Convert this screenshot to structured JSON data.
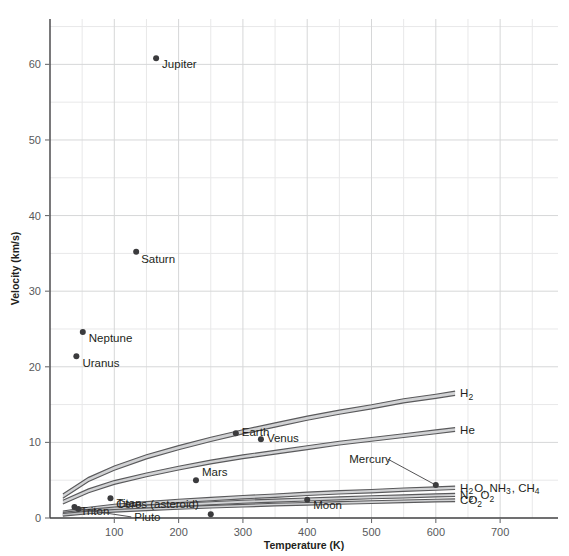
{
  "chart_data": {
    "type": "scatter",
    "title": "",
    "xlabel": "Temperature (K)",
    "ylabel": "Velocity (km/s)",
    "xlim": [
      0,
      790
    ],
    "ylim": [
      0,
      66
    ],
    "grid": true,
    "legend_position": "inline-right",
    "x_ticks": [
      100,
      200,
      300,
      400,
      500,
      600,
      700
    ],
    "x_tick_labels": [
      "100",
      "200",
      "300",
      "400",
      "500",
      "600",
      "700"
    ],
    "x_minor_ticks": [
      50,
      150,
      250,
      350,
      450,
      550,
      650,
      750
    ],
    "y_ticks": [
      0,
      10,
      20,
      30,
      40,
      50,
      60
    ],
    "y_tick_labels": [
      "0",
      "10",
      "20",
      "30",
      "40",
      "50",
      "60"
    ],
    "y_minor_ticks": [
      5,
      15,
      25,
      35,
      45,
      55,
      65
    ],
    "points": [
      {
        "name": "Jupiter",
        "label": "Jupiter",
        "x": 165,
        "y": 60.8,
        "label_dx": 6,
        "label_dy": 10,
        "leader": false
      },
      {
        "name": "Saturn",
        "label": "Saturn",
        "x": 134,
        "y": 35.2,
        "label_dx": 5,
        "label_dy": 11,
        "leader": false
      },
      {
        "name": "Neptune",
        "label": "Neptune",
        "x": 51,
        "y": 24.6,
        "label_dx": 6,
        "label_dy": 10,
        "leader": false
      },
      {
        "name": "Uranus",
        "label": "Uranus",
        "x": 41,
        "y": 21.4,
        "label_dx": 6,
        "label_dy": 11,
        "leader": false
      },
      {
        "name": "Earth",
        "label": "Earth",
        "x": 289,
        "y": 11.2,
        "label_dx": 6,
        "label_dy": 3,
        "leader": false
      },
      {
        "name": "Venus",
        "label": "Venus",
        "x": 328,
        "y": 10.4,
        "label_dx": 6,
        "label_dy": 3,
        "leader": false
      },
      {
        "name": "Mars",
        "label": "Mars",
        "x": 227,
        "y": 5.0,
        "label_dx": 6,
        "label_dy": -4,
        "leader": false
      },
      {
        "name": "Mercury",
        "label": "Mercury",
        "x": 600,
        "y": 4.35,
        "label_dx": -45,
        "label_dy": -22,
        "leader": true
      },
      {
        "name": "Titan",
        "label": "Titan",
        "x": 94,
        "y": 2.6,
        "label_dx": 6,
        "label_dy": 9,
        "leader": false
      },
      {
        "name": "Triton",
        "label": "Triton",
        "x": 38,
        "y": 1.45,
        "label_dx": 6,
        "label_dy": 8,
        "leader": false
      },
      {
        "name": "Pluto",
        "label": "Pluto",
        "x": 44,
        "y": 1.2,
        "label_dx": 56,
        "label_dy": 12,
        "leader": true
      },
      {
        "name": "Moon",
        "label": "Moon",
        "x": 400,
        "y": 2.4,
        "label_dx": 6,
        "label_dy": 9,
        "leader": false
      },
      {
        "name": "Ceres (asteroid)",
        "label": "Ceres (asteroid)",
        "x": 250,
        "y": 0.5,
        "label_dx": -12,
        "label_dy": -6,
        "leader": false
      }
    ],
    "series": [
      {
        "name": "H2",
        "label_html": "H<sub>2</sub>",
        "label_plain": "H2",
        "x": [
          20,
          60,
          100,
          150,
          200,
          250,
          300,
          350,
          400,
          450,
          500,
          550,
          600,
          630
        ],
        "values": [
          2.9,
          5.1,
          6.6,
          8.1,
          9.3,
          10.4,
          11.4,
          12.3,
          13.2,
          14.0,
          14.7,
          15.5,
          16.1,
          16.5
        ],
        "band_width": 0.55
      },
      {
        "name": "He",
        "label_html": "He",
        "label_plain": "He",
        "x": [
          20,
          60,
          100,
          150,
          200,
          250,
          300,
          350,
          400,
          450,
          500,
          550,
          600,
          630
        ],
        "values": [
          2.1,
          3.6,
          4.7,
          5.7,
          6.6,
          7.4,
          8.1,
          8.7,
          9.3,
          9.9,
          10.4,
          10.9,
          11.4,
          11.7
        ],
        "band_width": 0.5
      },
      {
        "name": "H2O, NH3, CH4",
        "label_html": "H<sub>2</sub>O, NH<sub>3</sub>, CH<sub>4</sub>",
        "label_plain": "H2O, NH3, CH4",
        "x": [
          20,
          60,
          100,
          150,
          200,
          250,
          300,
          350,
          400,
          450,
          500,
          550,
          600,
          630
        ],
        "values": [
          0.7,
          1.2,
          1.6,
          1.95,
          2.25,
          2.5,
          2.75,
          2.95,
          3.2,
          3.4,
          3.55,
          3.75,
          3.9,
          4.0
        ],
        "band_width": 0.45
      },
      {
        "name": "N2, O2",
        "label_html": "N<sub>2</sub>, O<sub>2</sub>",
        "label_plain": "N2, O2",
        "x": [
          20,
          60,
          100,
          150,
          200,
          250,
          300,
          350,
          400,
          450,
          500,
          550,
          600,
          630
        ],
        "values": [
          0.55,
          0.95,
          1.25,
          1.5,
          1.75,
          1.95,
          2.15,
          2.3,
          2.45,
          2.6,
          2.75,
          2.85,
          3.0,
          3.05
        ],
        "band_width": 0.4
      },
      {
        "name": "CO2",
        "label_html": "CO<sub>2</sub>",
        "label_plain": "CO2",
        "x": [
          20,
          60,
          100,
          150,
          200,
          250,
          300,
          350,
          400,
          450,
          500,
          550,
          600,
          630
        ],
        "values": [
          0.42,
          0.73,
          0.95,
          1.15,
          1.33,
          1.5,
          1.63,
          1.77,
          1.88,
          2.0,
          2.1,
          2.2,
          2.3,
          2.35
        ],
        "band_width": 0.35
      }
    ],
    "colors": {
      "point": "#3b3b3d",
      "band_fill": "#c9cacc",
      "band_edge": "#5a5a5c",
      "grid_major": "#d6d7d8",
      "grid_minor": "#e8e8e9",
      "axis": "#414042",
      "text": "#231f20",
      "tick_text": "#58595b"
    }
  }
}
